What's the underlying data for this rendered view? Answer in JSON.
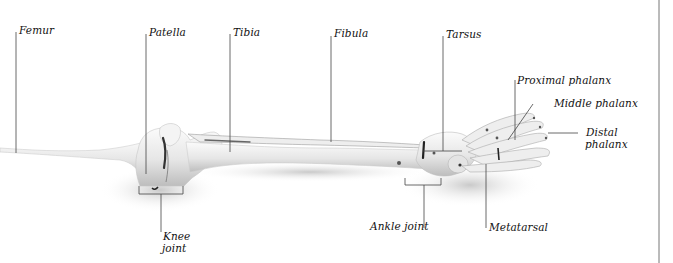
{
  "diagram": {
    "colors": {
      "ink": "#111111",
      "line": "#444444",
      "bone_light": "#f2f2f2",
      "bone_mid": "#d6d6d6",
      "bone_dark": "#9a9a9a",
      "shadow": "#c8c8c8",
      "rule": "#777777"
    },
    "labels": {
      "femur": "Femur",
      "patella": "Patella",
      "tibia": "Tibia",
      "fibula": "Fibula",
      "tarsus": "Tarsus",
      "proximal_phalanx": "Proximal phalanx",
      "middle_phalanx": "Middle phalanx",
      "distal_phalanx_line1": "Distal",
      "distal_phalanx_line2": "phalanx",
      "knee_joint_line1": "Knee",
      "knee_joint_line2": "joint",
      "ankle_joint": "Ankle joint",
      "metatarsal": "Metatarsal"
    }
  }
}
